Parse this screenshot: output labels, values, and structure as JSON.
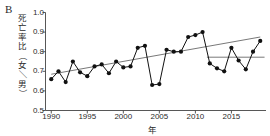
{
  "panel": {
    "label": "B"
  },
  "axes": {
    "ylabel": "死亡率比（女／男）",
    "ylabel_chars": [
      "死",
      "亡",
      "率",
      "比",
      "（",
      "女",
      "／",
      "男",
      "）"
    ],
    "xlabel": "年",
    "yticks": [
      "0.5",
      "0.6",
      "0.7",
      "0.8",
      "0.9",
      "1.0"
    ],
    "xticks": [
      "1990",
      "1995",
      "2000",
      "2005",
      "2010",
      "2015"
    ]
  },
  "colors": {
    "axis": "#444444",
    "marker": "#111111",
    "series_line": "#111111",
    "trend_line": "#555555",
    "reference_line": "#555555",
    "background": "#ffffff",
    "text": "#2b2b2b"
  },
  "chart_data": {
    "type": "line",
    "title": "",
    "subtitle": "",
    "xlabel": "年",
    "ylabel": "死亡率比（女／男）",
    "xlim": [
      1989.2,
      2019.8
    ],
    "ylim": [
      0.5,
      1.0
    ],
    "ytick_values": [
      0.5,
      0.6,
      0.7,
      0.8,
      0.9,
      1.0
    ],
    "xtick_values": [
      1990,
      1995,
      2000,
      2005,
      2010,
      2015
    ],
    "grid": false,
    "legend": null,
    "markers": "filled-circle",
    "x": [
      1990,
      1991,
      1992,
      1993,
      1994,
      1995,
      1996,
      1997,
      1998,
      1999,
      2000,
      2001,
      2002,
      2003,
      2004,
      2005,
      2006,
      2007,
      2008,
      2009,
      2010,
      2011,
      2012,
      2013,
      2014,
      2015,
      2016,
      2017,
      2018,
      2019
    ],
    "series": [
      {
        "name": "死亡率比（女／男）",
        "values": [
          0.66,
          0.7,
          0.645,
          0.75,
          0.695,
          0.675,
          0.725,
          0.735,
          0.69,
          0.75,
          0.72,
          0.725,
          0.82,
          0.83,
          0.63,
          0.635,
          0.81,
          0.8,
          0.8,
          0.875,
          0.885,
          0.9,
          0.74,
          0.715,
          0.7,
          0.82,
          0.755,
          0.71,
          0.8,
          0.855
        ]
      }
    ],
    "annotations": [
      {
        "type": "trend-line",
        "name": "overall-trend-line",
        "x_start": 1990,
        "y_start": 0.685,
        "x_end": 2019,
        "y_end": 0.875
      },
      {
        "type": "reference-line",
        "name": "late-period-reference-line",
        "x_start": 2011.6,
        "y_start": 0.772,
        "x_end": 2019.6,
        "y_end": 0.772
      }
    ]
  }
}
